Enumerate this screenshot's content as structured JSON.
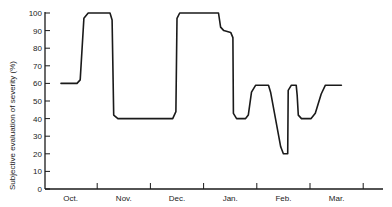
{
  "chart_data": {
    "type": "line",
    "title": "",
    "xlabel": "",
    "ylabel": "Subjective evaluation of severity   (%)",
    "ylim": [
      0,
      100
    ],
    "yticks": [
      0,
      10,
      20,
      30,
      40,
      50,
      60,
      70,
      80,
      90,
      100
    ],
    "categories": [
      "Oct.",
      "Nov.",
      "Dec.",
      "Jan.",
      "Feb.",
      "Mar."
    ],
    "xlim_months": [
      0,
      6.45
    ],
    "grid": false,
    "legend": null,
    "series": [
      {
        "name": "severity",
        "color": "#1a1a1a",
        "points": [
          [
            0.32,
            60
          ],
          [
            0.62,
            60
          ],
          [
            0.68,
            62
          ],
          [
            0.75,
            97
          ],
          [
            0.83,
            100
          ],
          [
            1.24,
            100
          ],
          [
            1.28,
            96
          ],
          [
            1.31,
            42
          ],
          [
            1.39,
            40
          ],
          [
            2.42,
            40
          ],
          [
            2.48,
            44
          ],
          [
            2.5,
            97
          ],
          [
            2.55,
            100
          ],
          [
            3.28,
            100
          ],
          [
            3.32,
            92
          ],
          [
            3.38,
            90
          ],
          [
            3.51,
            89
          ],
          [
            3.55,
            86
          ],
          [
            3.56,
            43
          ],
          [
            3.62,
            40
          ],
          [
            3.79,
            40
          ],
          [
            3.84,
            42
          ],
          [
            3.9,
            55
          ],
          [
            3.98,
            59
          ],
          [
            4.22,
            59
          ],
          [
            4.26,
            55
          ],
          [
            4.45,
            24
          ],
          [
            4.5,
            20
          ],
          [
            4.58,
            20
          ],
          [
            4.59,
            56
          ],
          [
            4.65,
            59
          ],
          [
            4.74,
            59
          ],
          [
            4.76,
            53
          ],
          [
            4.78,
            42
          ],
          [
            4.84,
            40
          ],
          [
            5.02,
            40
          ],
          [
            5.1,
            43
          ],
          [
            5.21,
            54
          ],
          [
            5.29,
            59
          ],
          [
            5.59,
            59
          ]
        ]
      }
    ]
  }
}
